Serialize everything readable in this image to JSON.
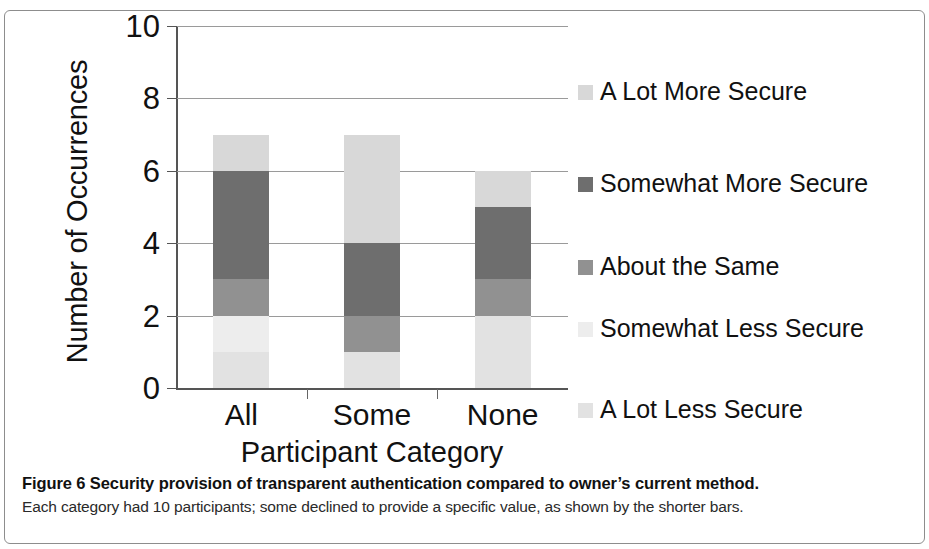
{
  "figure": {
    "caption_title": "Figure 6  Security provision of transparent authentication compared to owner’s current method.",
    "caption_subtitle": "Each category had 10 participants; some declined to provide a specific value, as shown by the shorter bars."
  },
  "chart_data": {
    "type": "bar",
    "subtype": "stacked-bar",
    "title": "",
    "xlabel": "Participant Category",
    "ylabel": "Number of Occurrences",
    "ylim": [
      0,
      10
    ],
    "yticks": [
      0,
      2,
      4,
      6,
      8,
      10
    ],
    "ytick_labels": [
      "0",
      "2",
      "4",
      "6",
      "8",
      "10"
    ],
    "grid": true,
    "grid_axis": "y",
    "legend_position": "right",
    "categories": [
      "All",
      "Some",
      "None"
    ],
    "series": [
      {
        "name": "A Lot Less Secure",
        "color": "#e2e2e2",
        "values": [
          1,
          1,
          2
        ]
      },
      {
        "name": "Somewhat Less Secure",
        "color": "#ededed",
        "values": [
          1,
          0,
          0
        ]
      },
      {
        "name": "About the Same",
        "color": "#919191",
        "values": [
          1,
          1,
          1
        ]
      },
      {
        "name": "Somewhat More Secure",
        "color": "#6e6e6e",
        "values": [
          3,
          2,
          2
        ]
      },
      {
        "name": "A Lot More Secure",
        "color": "#d8d8d8",
        "values": [
          1,
          3,
          1
        ]
      }
    ],
    "totals": [
      7,
      7,
      6
    ],
    "legend_order": [
      "A Lot More Secure",
      "Somewhat More Secure",
      "About the Same",
      "Somewhat Less Secure",
      "A Lot Less Secure"
    ],
    "legend": [
      {
        "label": "A Lot More Secure",
        "color": "#d8d8d8"
      },
      {
        "label": "Somewhat More Secure",
        "color": "#6e6e6e"
      },
      {
        "label": "About the Same",
        "color": "#919191"
      },
      {
        "label": "Somewhat Less Secure",
        "color": "#ededed"
      },
      {
        "label": "A Lot Less Secure",
        "color": "#e2e2e2"
      }
    ]
  }
}
